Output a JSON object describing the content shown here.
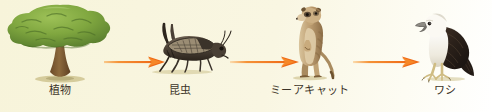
{
  "diagram": {
    "type": "food-chain",
    "title": "",
    "background_color": "#f7f4da",
    "label_color": "#3c3428",
    "arrow_color": "#f0691a",
    "arrow_color_light": "#f7a64a",
    "nodes": [
      {
        "id": "plants",
        "label": "植物",
        "icon": "tree-illustration",
        "order": 1,
        "colors": {
          "foliage": "#7fa63f",
          "foliage_dark": "#5d8230",
          "trunk": "#7d5a33"
        }
      },
      {
        "id": "insects",
        "label": "昆虫",
        "icon": "grasshopper-illustration",
        "order": 2,
        "colors": {
          "body": "#4a4035",
          "body_dark": "#2d261d",
          "wing": "#7a6b55"
        }
      },
      {
        "id": "meerkat",
        "label": "ミーアキャット",
        "icon": "meerkat-illustration",
        "order": 3,
        "colors": {
          "fur": "#b99a6f",
          "fur_dark": "#8a6c45",
          "belly": "#ddc7a2"
        }
      },
      {
        "id": "eagle",
        "label": "ワシ",
        "icon": "eagle-illustration",
        "order": 4,
        "colors": {
          "head": "#f2efe6",
          "wing": "#2b211a",
          "beak": "#6e6a60",
          "talons": "#d8c58a"
        }
      }
    ],
    "arrows": [
      {
        "id": "arrow-plants-to-insects",
        "from": "plants",
        "to": "insects",
        "icon": "arrow-right-icon"
      },
      {
        "id": "arrow-insects-to-meerkat",
        "from": "insects",
        "to": "meerkat",
        "icon": "arrow-right-icon"
      },
      {
        "id": "arrow-meerkat-to-eagle",
        "from": "meerkat",
        "to": "eagle",
        "icon": "arrow-right-icon"
      }
    ]
  }
}
